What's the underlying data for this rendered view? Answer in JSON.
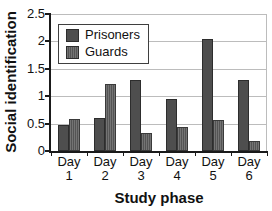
{
  "chart_data": {
    "type": "bar",
    "title": "",
    "categories": [
      "Day 1",
      "Day 2",
      "Day 3",
      "Day 4",
      "Day 5",
      "Day 6"
    ],
    "series": [
      {
        "name": "Prisoners",
        "values": [
          0.47,
          0.61,
          1.3,
          0.95,
          2.04,
          1.3
        ],
        "color": "#4e4e4e",
        "border": "#2d2d2d",
        "pattern": "solid"
      },
      {
        "name": "Guards",
        "values": [
          0.58,
          1.23,
          0.32,
          0.43,
          0.57,
          0.18
        ],
        "color": "#747474",
        "stripe": "#545454",
        "border": "#3a3a3a",
        "pattern": "vertical-stripes"
      }
    ],
    "xlabel": "Study phase",
    "ylabel": "Social identification",
    "ylim": [
      0,
      2.5
    ],
    "yticks": [
      0,
      0.5,
      1,
      1.5,
      2,
      2.5
    ],
    "grid": true,
    "legend_position": "upper-left"
  },
  "colors": {
    "background": "#ffffff",
    "grid": "#bcbcbc",
    "axis": "#1a1a1a",
    "text": "#111111",
    "legend_border": "#3f3f3f"
  }
}
